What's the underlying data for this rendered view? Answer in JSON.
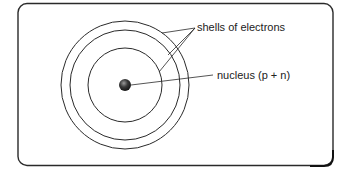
{
  "diagram": {
    "type": "atom-structure",
    "labels": {
      "shells": "shells of electrons",
      "nucleus": "nucleus (p + n)"
    },
    "shells_count": 3,
    "colors": {
      "stroke": "#2a2a2a",
      "nucleus": "#3a3a3a",
      "background": "#ffffff"
    }
  }
}
